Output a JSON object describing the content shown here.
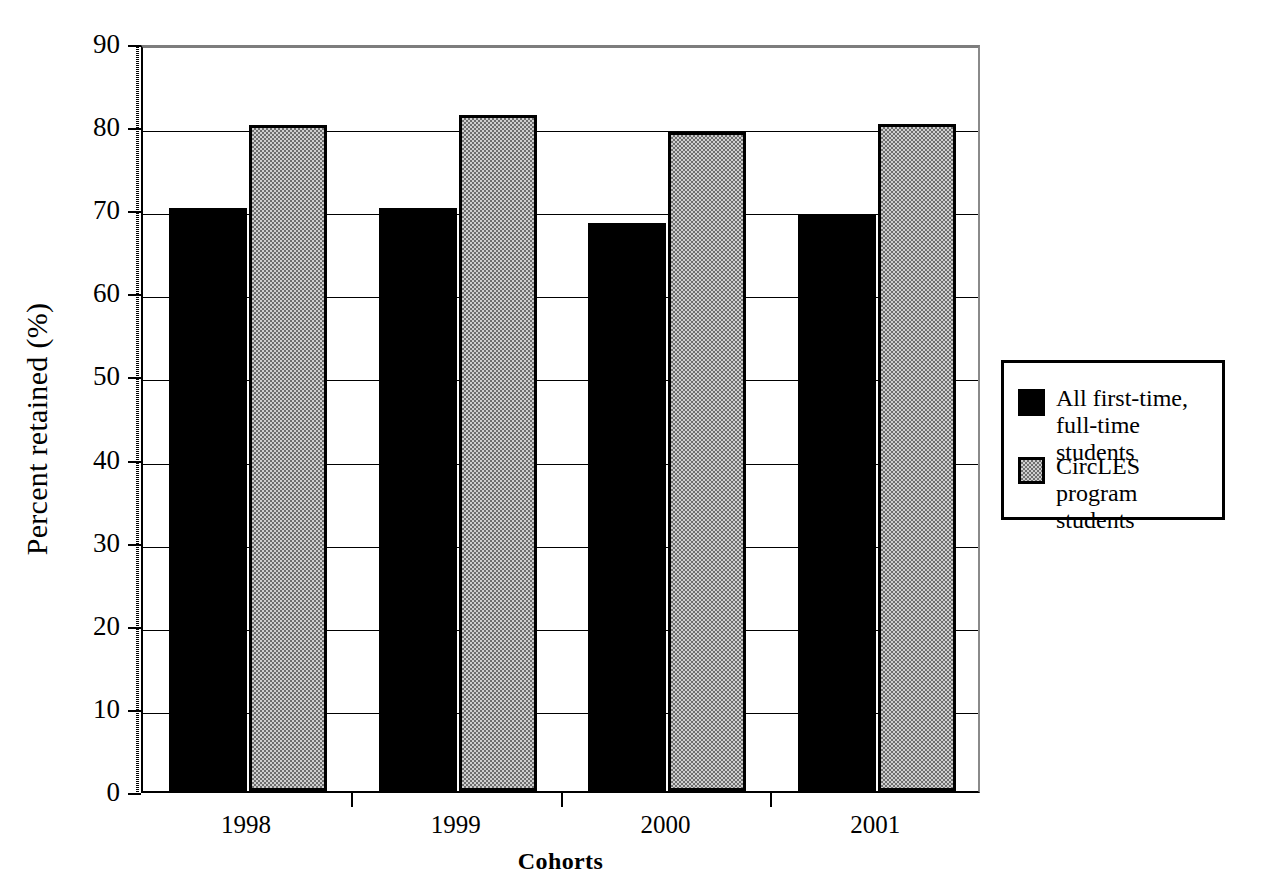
{
  "chart_data": {
    "type": "bar",
    "title": "",
    "xlabel": "Cohorts",
    "ylabel": "Percent retained (%)",
    "categories": [
      "1998",
      "1999",
      "2000",
      "2001"
    ],
    "series": [
      {
        "name": "All first-time,\nfull-time students",
        "color": "#000000",
        "fill": "solid-black",
        "values": [
          70.2,
          70.2,
          68.3,
          69.3
        ]
      },
      {
        "name": "CircLES program\nstudents",
        "color": "#9a9a9a",
        "fill": "gray-checker",
        "values": [
          80.1,
          81.3,
          79.3,
          80.3
        ]
      }
    ],
    "ylim": [
      0,
      90
    ],
    "yticks": [
      0,
      10,
      20,
      30,
      40,
      50,
      60,
      70,
      80,
      90
    ],
    "ytick_labels": [
      "0",
      "10",
      "20",
      "30",
      "40",
      "50",
      "60",
      "70",
      "80",
      "90"
    ],
    "grid": "horizontal",
    "legend_position": "right-middle"
  },
  "axes": {
    "y_title": "Percent retained (%)",
    "x_title": "Cohorts"
  },
  "legend": {
    "entries": [
      {
        "label": "All first-time,\nfull-time students",
        "swatch": "black-square"
      },
      {
        "label": "CircLES program\nstudents",
        "swatch": "gray-square"
      }
    ]
  }
}
